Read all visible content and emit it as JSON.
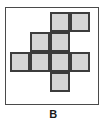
{
  "figure": {
    "label": "B",
    "type": "cube-net-hexomino",
    "colors": {
      "cell_fill": "#d4d4d4",
      "cell_border": "#3c3c3c",
      "frame_border": "#4a4a4a",
      "background": "#ffffff",
      "label_color": "#1a1a1a"
    },
    "grid": {
      "columns": 4,
      "rows": 4,
      "cell_size_px": 20,
      "origin_x_px": 4,
      "origin_y_px": 4
    },
    "cells": [
      {
        "id": "cell-r0-c2",
        "row": 0,
        "col": 2
      },
      {
        "id": "cell-r0-c3",
        "row": 0,
        "col": 3
      },
      {
        "id": "cell-r1-c1",
        "row": 1,
        "col": 1
      },
      {
        "id": "cell-r1-c2",
        "row": 1,
        "col": 2
      },
      {
        "id": "cell-r2-c0",
        "row": 2,
        "col": 0
      },
      {
        "id": "cell-r2-c1",
        "row": 2,
        "col": 1
      },
      {
        "id": "cell-r2-c2",
        "row": 2,
        "col": 2
      },
      {
        "id": "cell-r2-c3",
        "row": 2,
        "col": 3
      },
      {
        "id": "cell-r3-c2",
        "row": 3,
        "col": 2
      }
    ]
  }
}
